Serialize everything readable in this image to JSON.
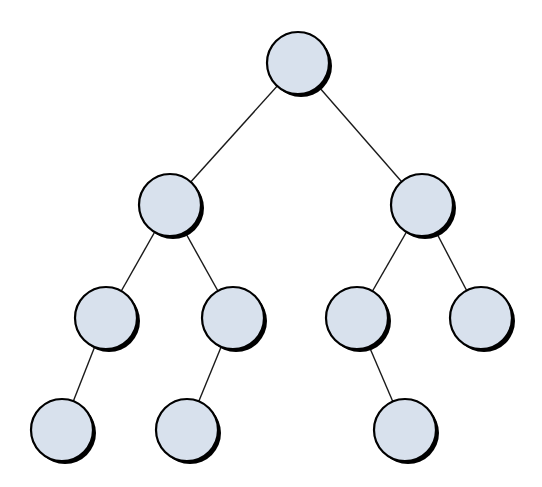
{
  "diagram": {
    "type": "binary-tree",
    "width": 542,
    "height": 487,
    "colors": {
      "background": "#ffffff",
      "node_fill": "#d8e1ed",
      "node_stroke": "#000000",
      "node_shadow": "#000000",
      "edge": "#1a1a1a"
    },
    "node_radius": 31,
    "shadow_offset": [
      3,
      3
    ],
    "nodes": [
      {
        "id": "root",
        "level": 0,
        "x": 298,
        "y": 63
      },
      {
        "id": "l1-left",
        "level": 1,
        "x": 170,
        "y": 205
      },
      {
        "id": "l1-right",
        "level": 1,
        "x": 422,
        "y": 205
      },
      {
        "id": "l2-a",
        "level": 2,
        "x": 106,
        "y": 318
      },
      {
        "id": "l2-b",
        "level": 2,
        "x": 233,
        "y": 318
      },
      {
        "id": "l2-c",
        "level": 2,
        "x": 357,
        "y": 318
      },
      {
        "id": "l2-d",
        "level": 2,
        "x": 481,
        "y": 318
      },
      {
        "id": "l3-a",
        "level": 3,
        "x": 62,
        "y": 430
      },
      {
        "id": "l3-b",
        "level": 3,
        "x": 187,
        "y": 430
      },
      {
        "id": "l3-c",
        "level": 3,
        "x": 405,
        "y": 430
      }
    ],
    "edges": [
      {
        "from": "root",
        "to": "l1-left"
      },
      {
        "from": "root",
        "to": "l1-right"
      },
      {
        "from": "l1-left",
        "to": "l2-a"
      },
      {
        "from": "l1-left",
        "to": "l2-b"
      },
      {
        "from": "l1-right",
        "to": "l2-c"
      },
      {
        "from": "l1-right",
        "to": "l2-d"
      },
      {
        "from": "l2-a",
        "to": "l3-a"
      },
      {
        "from": "l2-b",
        "to": "l3-b"
      },
      {
        "from": "l2-c",
        "to": "l3-c"
      }
    ]
  }
}
